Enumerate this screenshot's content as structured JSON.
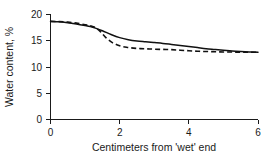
{
  "chart_data": {
    "type": "line",
    "title": "",
    "subtitle": "",
    "xlabel": "Centimeters from 'wet' end",
    "ylabel": "Water content, %",
    "xlim": [
      0,
      6
    ],
    "ylim": [
      0,
      20
    ],
    "xticks": [
      0,
      2,
      4,
      6
    ],
    "yticks": [
      0,
      5,
      10,
      15,
      20
    ],
    "xtick_labels": [
      "0",
      "2",
      "4",
      "6"
    ],
    "ytick_labels": [
      "0",
      "5",
      "10",
      "15",
      "20"
    ],
    "grid": false,
    "legend": "none",
    "annotations": [],
    "series": [
      {
        "name": "solid-curve",
        "style": "solid",
        "color": "#111111",
        "x": [
          0.0,
          0.25,
          0.5,
          0.75,
          1.0,
          1.15,
          1.3,
          1.5,
          1.75,
          2.0,
          2.25,
          2.5,
          2.75,
          3.0,
          3.25,
          3.5,
          3.75,
          4.0,
          4.25,
          4.5,
          4.75,
          5.0,
          5.25,
          5.5,
          5.75,
          6.0
        ],
        "y": [
          18.7,
          18.6,
          18.45,
          18.2,
          17.9,
          17.7,
          17.4,
          16.9,
          16.2,
          15.6,
          15.2,
          14.95,
          14.8,
          14.65,
          14.5,
          14.3,
          14.1,
          13.9,
          13.7,
          13.5,
          13.35,
          13.2,
          13.05,
          12.95,
          12.88,
          12.82
        ]
      },
      {
        "name": "dashed-curve",
        "style": "dashed",
        "color": "#111111",
        "x": [
          0.0,
          0.25,
          0.5,
          0.75,
          1.0,
          1.15,
          1.3,
          1.45,
          1.6,
          1.8,
          2.0,
          2.2,
          2.4,
          2.6,
          2.8,
          3.0,
          3.25,
          3.5,
          3.75,
          4.0,
          4.25,
          4.5,
          4.75,
          5.0,
          5.25,
          5.5,
          5.75,
          6.0
        ],
        "y": [
          18.7,
          18.65,
          18.55,
          18.35,
          18.05,
          17.85,
          17.5,
          16.7,
          15.6,
          14.6,
          14.05,
          13.75,
          13.6,
          13.5,
          13.45,
          13.4,
          13.35,
          13.3,
          13.2,
          13.1,
          13.0,
          12.95,
          12.9,
          12.85,
          12.85,
          12.82,
          12.8,
          12.8
        ]
      }
    ]
  },
  "axes": {
    "ylabel": "Water content, %",
    "xlabel": "Centimeters from 'wet' end",
    "ytick_labels": [
      "20",
      "15",
      "10",
      "5",
      "0"
    ],
    "xtick_labels": [
      "0",
      "2",
      "4",
      "6"
    ]
  },
  "colors": {
    "background": "#ffffff",
    "foreground": "#1a1a1a",
    "line": "#111111"
  }
}
